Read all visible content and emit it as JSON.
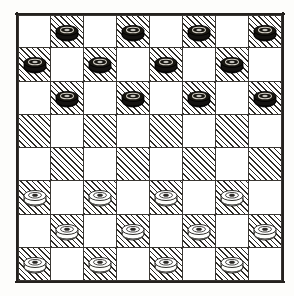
{
  "board": {
    "title": "Checkers board",
    "rows": 8,
    "columns": 8,
    "colors": {
      "light_square": "#ffffff",
      "dark_square_hatch": "#2e2b27",
      "line": "#3a3733",
      "black_piece": "#141210",
      "white_piece": "#fdfdfb",
      "background": "#fdfdfb"
    },
    "square_pattern_note": "dark squares on odd columns of row 0",
    "black_piece_count": 12,
    "white_piece_count": 12,
    "cells": [
      [
        {
          "shade": "light",
          "piece": "none"
        },
        {
          "shade": "dark",
          "piece": "black"
        },
        {
          "shade": "light",
          "piece": "none"
        },
        {
          "shade": "dark",
          "piece": "black"
        },
        {
          "shade": "light",
          "piece": "none"
        },
        {
          "shade": "dark",
          "piece": "black"
        },
        {
          "shade": "light",
          "piece": "none"
        },
        {
          "shade": "dark",
          "piece": "black"
        }
      ],
      [
        {
          "shade": "dark",
          "piece": "black"
        },
        {
          "shade": "light",
          "piece": "none"
        },
        {
          "shade": "dark",
          "piece": "black"
        },
        {
          "shade": "light",
          "piece": "none"
        },
        {
          "shade": "dark",
          "piece": "black"
        },
        {
          "shade": "light",
          "piece": "none"
        },
        {
          "shade": "dark",
          "piece": "black"
        },
        {
          "shade": "light",
          "piece": "none"
        }
      ],
      [
        {
          "shade": "light",
          "piece": "none"
        },
        {
          "shade": "dark",
          "piece": "black"
        },
        {
          "shade": "light",
          "piece": "none"
        },
        {
          "shade": "dark",
          "piece": "black"
        },
        {
          "shade": "light",
          "piece": "none"
        },
        {
          "shade": "dark",
          "piece": "black"
        },
        {
          "shade": "light",
          "piece": "none"
        },
        {
          "shade": "dark",
          "piece": "black"
        }
      ],
      [
        {
          "shade": "dark",
          "piece": "none"
        },
        {
          "shade": "light",
          "piece": "none"
        },
        {
          "shade": "dark",
          "piece": "none"
        },
        {
          "shade": "light",
          "piece": "none"
        },
        {
          "shade": "dark",
          "piece": "none"
        },
        {
          "shade": "light",
          "piece": "none"
        },
        {
          "shade": "dark",
          "piece": "none"
        },
        {
          "shade": "light",
          "piece": "none"
        }
      ],
      [
        {
          "shade": "light",
          "piece": "none"
        },
        {
          "shade": "dark",
          "piece": "none"
        },
        {
          "shade": "light",
          "piece": "none"
        },
        {
          "shade": "dark",
          "piece": "none"
        },
        {
          "shade": "light",
          "piece": "none"
        },
        {
          "shade": "dark",
          "piece": "none"
        },
        {
          "shade": "light",
          "piece": "none"
        },
        {
          "shade": "dark",
          "piece": "none"
        }
      ],
      [
        {
          "shade": "dark",
          "piece": "white"
        },
        {
          "shade": "light",
          "piece": "none"
        },
        {
          "shade": "dark",
          "piece": "white"
        },
        {
          "shade": "light",
          "piece": "none"
        },
        {
          "shade": "dark",
          "piece": "white"
        },
        {
          "shade": "light",
          "piece": "none"
        },
        {
          "shade": "dark",
          "piece": "white"
        },
        {
          "shade": "light",
          "piece": "none"
        }
      ],
      [
        {
          "shade": "light",
          "piece": "none"
        },
        {
          "shade": "dark",
          "piece": "white"
        },
        {
          "shade": "light",
          "piece": "none"
        },
        {
          "shade": "dark",
          "piece": "white"
        },
        {
          "shade": "light",
          "piece": "none"
        },
        {
          "shade": "dark",
          "piece": "white"
        },
        {
          "shade": "light",
          "piece": "none"
        },
        {
          "shade": "dark",
          "piece": "white"
        }
      ],
      [
        {
          "shade": "dark",
          "piece": "white"
        },
        {
          "shade": "light",
          "piece": "none"
        },
        {
          "shade": "dark",
          "piece": "white"
        },
        {
          "shade": "light",
          "piece": "none"
        },
        {
          "shade": "dark",
          "piece": "white"
        },
        {
          "shade": "light",
          "piece": "none"
        },
        {
          "shade": "dark",
          "piece": "white"
        },
        {
          "shade": "light",
          "piece": "none"
        }
      ]
    ]
  }
}
